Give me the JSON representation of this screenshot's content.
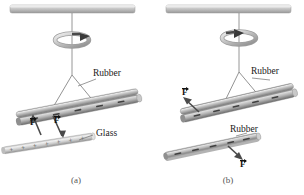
{
  "figure": {
    "background": "#ffffff",
    "width": 304,
    "height": 195
  },
  "panels": [
    {
      "id": "a",
      "caption": "(a)",
      "description": "Negatively charged rubber rod suspended from a swivel is attracted to a positively charged glass rod",
      "labels": [
        {
          "name": "rubber-label",
          "text": "Rubber",
          "x": 93,
          "y": 74
        },
        {
          "name": "glass-label",
          "text": "Glass",
          "x": 96,
          "y": 133
        }
      ],
      "force_vectors": [
        {
          "name": "force-label-left",
          "text": "F",
          "x": 31,
          "y": 122
        },
        {
          "name": "force-label-right",
          "text": "F",
          "x": 55,
          "y": 120
        }
      ],
      "rods": [
        {
          "name": "suspended-rubber-rod",
          "material": "Rubber",
          "charge_sign": "−",
          "charge_count": 5
        },
        {
          "name": "handheld-glass-rod",
          "material": "Glass",
          "charge_sign": "+",
          "charge_count": 7
        }
      ],
      "swivel": {
        "name": "rotation-swivel",
        "rotation": "clockwise"
      },
      "support": {
        "name": "ceiling-support-bar"
      }
    },
    {
      "id": "b",
      "caption": "(b)",
      "description": "Negatively charged rubber rod suspended from a swivel is repelled by another negatively charged rubber rod",
      "labels": [
        {
          "name": "rubber-label-top",
          "text": "Rubber",
          "x": 99,
          "y": 72
        },
        {
          "name": "rubber-label-bottom",
          "text": "Rubber",
          "x": 78,
          "y": 129
        }
      ],
      "force_vectors": [
        {
          "name": "force-label-upper",
          "text": "F",
          "x": 31,
          "y": 92
        },
        {
          "name": "force-label-lower",
          "text": "F",
          "x": 85,
          "y": 160
        }
      ],
      "rods": [
        {
          "name": "suspended-rubber-rod",
          "material": "Rubber",
          "charge_sign": "−",
          "charge_count": 5
        },
        {
          "name": "handheld-rubber-rod",
          "material": "Rubber",
          "charge_sign": "−",
          "charge_count": 5
        }
      ],
      "swivel": {
        "name": "rotation-swivel",
        "rotation": "counterclockwise"
      },
      "support": {
        "name": "ceiling-support-bar"
      }
    }
  ],
  "colors": {
    "rod_light": "#d8d8d8",
    "rod_mid": "#a8a8a8",
    "rod_dark": "#6e6e6e",
    "support_bar": "#b5b5b5",
    "string": "#8a8a8a",
    "text": "#1a1a1a",
    "caption": "#555555",
    "charge": "#3a3a3a"
  }
}
